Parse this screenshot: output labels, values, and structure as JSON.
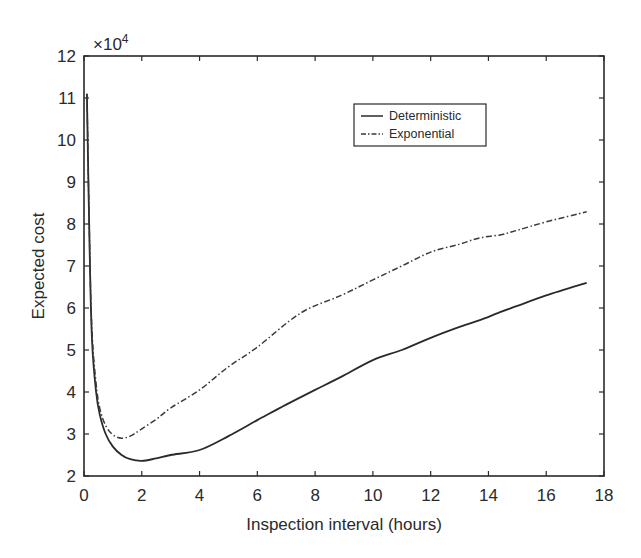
{
  "chart_data": {
    "type": "line",
    "title": "",
    "xlabel": "Inspection interval (hours)",
    "ylabel": "Expected cost",
    "y_multiplier_label": "×10",
    "y_multiplier_exponent": "4",
    "xlim": [
      0,
      18
    ],
    "ylim": [
      2,
      12
    ],
    "x_ticks": [
      0,
      2,
      4,
      6,
      8,
      10,
      12,
      14,
      16,
      18
    ],
    "y_ticks": [
      2,
      3,
      4,
      5,
      6,
      7,
      8,
      9,
      10,
      11,
      12
    ],
    "grid": false,
    "legend_position": "upper right (inside)",
    "series": [
      {
        "name": "Deterministic",
        "style": "solid",
        "x": [
          0.1,
          0.2,
          0.28,
          0.42,
          0.55,
          0.75,
          1.0,
          1.3,
          1.6,
          2.0,
          2.5,
          3.0,
          4.0,
          5.0,
          6.0,
          7.0,
          8.0,
          8.9,
          10.0,
          11.0,
          12.0,
          13.0,
          13.7,
          14.4,
          15.0,
          16.0,
          17.4
        ],
        "values": [
          11.1,
          7.2,
          5.2,
          4.0,
          3.45,
          3.0,
          2.7,
          2.5,
          2.4,
          2.36,
          2.42,
          2.5,
          2.62,
          2.95,
          3.33,
          3.7,
          4.05,
          4.36,
          4.76,
          5.0,
          5.29,
          5.55,
          5.71,
          5.9,
          6.05,
          6.3,
          6.6
        ]
      },
      {
        "name": "Exponential",
        "style": "dash-dot",
        "x": [
          0.1,
          0.2,
          0.28,
          0.42,
          0.55,
          0.75,
          1.0,
          1.3,
          1.6,
          1.95,
          2.5,
          3.0,
          4.0,
          5.0,
          6.0,
          7.5,
          8.9,
          10.0,
          11.0,
          12.0,
          13.0,
          13.7,
          14.4,
          15.0,
          16.0,
          17.4
        ],
        "values": [
          11.1,
          7.3,
          5.4,
          4.2,
          3.6,
          3.2,
          2.98,
          2.9,
          2.95,
          3.1,
          3.35,
          3.62,
          4.05,
          4.6,
          5.07,
          5.88,
          6.3,
          6.67,
          7.0,
          7.33,
          7.52,
          7.67,
          7.74,
          7.85,
          8.05,
          8.29
        ]
      }
    ]
  },
  "colors": {
    "axis": "#2a2a2a",
    "deterministic": "#2a2a2a",
    "exponential": "#3a3a3a",
    "background": "#ffffff"
  }
}
